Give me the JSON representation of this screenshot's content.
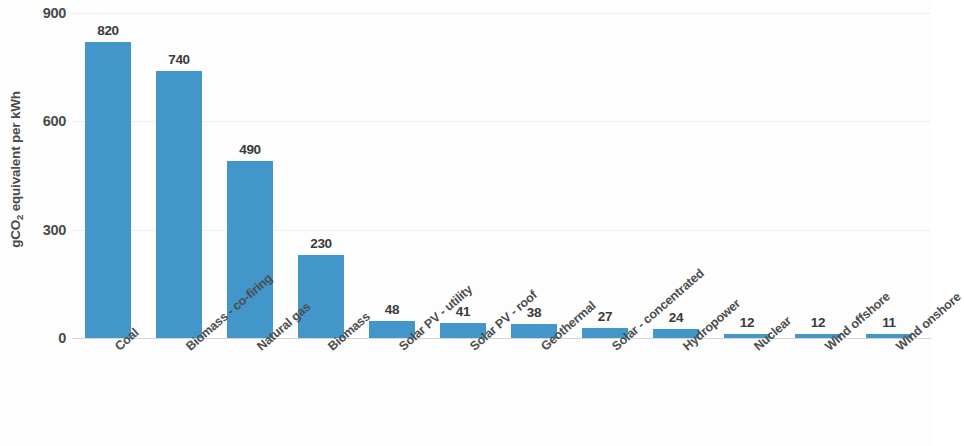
{
  "chart_data": {
    "type": "bar",
    "title": "",
    "subtitle": "",
    "xlabel": "",
    "ylabel": "gCO2 equivalent per kWh",
    "ylabel_parts": {
      "prefix": "gCO",
      "sub": "2",
      "suffix": " equivalent per kWh"
    },
    "categories": [
      "Coal",
      "Biomass - co-firing",
      "Natural gas",
      "Biomass",
      "Solar PV - utility",
      "Solar PV - roof",
      "Geothermal",
      "Solar - concentrated",
      "Hydropower",
      "Nuclear",
      "Wind offshore",
      "Wind onshore"
    ],
    "values": [
      820,
      740,
      490,
      230,
      48,
      41,
      38,
      27,
      24,
      12,
      12,
      11
    ],
    "value_labels": [
      "820",
      "740",
      "490",
      "230",
      "48",
      "41",
      "38",
      "27",
      "24",
      "12",
      "12",
      "11"
    ],
    "ylim": [
      0,
      900
    ],
    "yticks": [
      0,
      300,
      600,
      900
    ],
    "ytick_labels": [
      "0",
      "300",
      "600",
      "900"
    ],
    "grid": true,
    "legend": false,
    "legend_position": "none",
    "bar_color": "#4296ca",
    "text_color": "#4a4a4a",
    "background_color": "#fdfdfd",
    "gridline_color": "#f0f0f0",
    "axis_color": "#d6d6d6",
    "label_rotation_degrees": -41
  }
}
